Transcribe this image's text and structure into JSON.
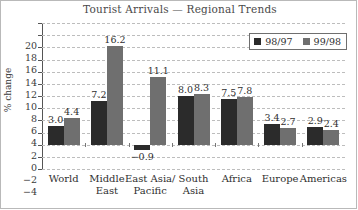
{
  "chart_data": {
    "type": "bar",
    "title": "Tourist Arrivals — Regional Trends",
    "xlabel": "",
    "ylabel": "% change",
    "ylim": [
      -4,
      20
    ],
    "ytick_step": 2,
    "yticks": [
      "20",
      "18",
      "16",
      "14",
      "12",
      "10",
      "8",
      "6",
      "4",
      "2",
      "0",
      "-2",
      "-4"
    ],
    "grid": "horizontal-dashed",
    "legend_position": "top-right",
    "categories": [
      "World",
      "Middle\nEast",
      "East Asia/\nPacific",
      "South\nAsia",
      "Africa",
      "Europe",
      "Americas"
    ],
    "series": [
      {
        "name": "98/97",
        "color": "#2b2b2b",
        "values": [
          3.0,
          7.2,
          -0.9,
          8.0,
          7.5,
          3.4,
          2.9
        ],
        "labels": [
          "3.0",
          "7.2",
          "-0.9",
          "8.0",
          "7.5",
          "3.4",
          "2.9"
        ]
      },
      {
        "name": "99/98",
        "color": "#6f6f6f",
        "values": [
          4.4,
          16.2,
          11.1,
          8.3,
          7.8,
          2.7,
          2.4
        ],
        "labels": [
          "4.4",
          "16.2",
          "11.1",
          "8.3",
          "7.8",
          "2.7",
          "2.4"
        ]
      }
    ]
  }
}
